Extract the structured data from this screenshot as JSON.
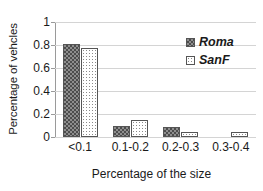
{
  "chart_data": {
    "type": "bar",
    "title": "",
    "xlabel": "Percentage of the size",
    "ylabel": "Percentage of vehcles",
    "categories": [
      "<0.1",
      "0.1-0.2",
      "0.2-0.3",
      "0.3-0.4"
    ],
    "series": [
      {
        "name": "Roma",
        "values": [
          0.81,
          0.1,
          0.09,
          0.0
        ]
      },
      {
        "name": "SanF",
        "values": [
          0.77,
          0.15,
          0.04,
          0.04
        ]
      }
    ],
    "ylim": [
      0,
      1
    ],
    "yticks": [
      0,
      0.2,
      0.4,
      0.6,
      0.8,
      1
    ],
    "ytick_labels": [
      "0",
      "0.2",
      "0.4",
      "0.6",
      "0.8",
      "1"
    ],
    "grid": true,
    "legend_position": "top-right",
    "colors": {
      "roma_fill": "#8e8e8e",
      "roma_pattern": "#4d4d4d",
      "sanf_fill": "#ffffff",
      "sanf_pattern": "#8a8a8a",
      "axis": "#9a9a9a",
      "gridline": "#d4d4d4",
      "text": "#1a1a1a"
    }
  }
}
